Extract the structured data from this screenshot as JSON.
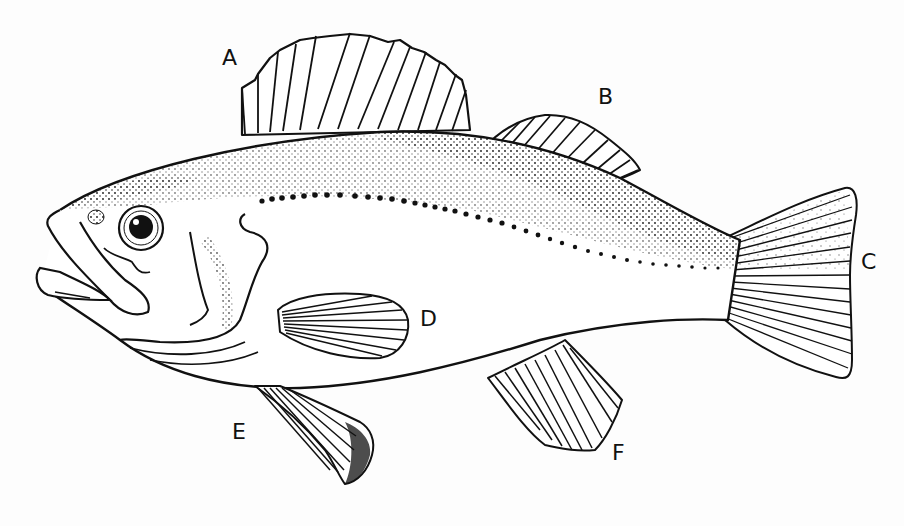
{
  "diagram": {
    "style": "black ink stipple line drawing on white",
    "colors": {
      "ink": "#111111",
      "background": "#fdfdfd"
    },
    "labels": [
      {
        "id": "A",
        "text": "A",
        "x": 222,
        "y": 47,
        "points_to": "spiny dorsal fin"
      },
      {
        "id": "B",
        "text": "B",
        "x": 598,
        "y": 86,
        "points_to": "soft dorsal fin"
      },
      {
        "id": "C",
        "text": "C",
        "x": 861,
        "y": 251,
        "points_to": "caudal (tail) fin"
      },
      {
        "id": "D",
        "text": "D",
        "x": 420,
        "y": 308,
        "points_to": "pectoral fin"
      },
      {
        "id": "E",
        "text": "E",
        "x": 232,
        "y": 421,
        "points_to": "pelvic fin"
      },
      {
        "id": "F",
        "text": "F",
        "x": 612,
        "y": 442,
        "points_to": "anal fin"
      }
    ]
  }
}
